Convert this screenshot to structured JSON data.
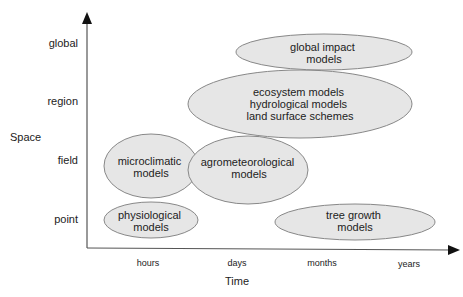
{
  "diagram": {
    "y_axis": {
      "title": "Space",
      "ticks": [
        "global",
        "region",
        "field",
        "point"
      ]
    },
    "x_axis": {
      "title": "Time",
      "ticks": [
        "hours",
        "days",
        "months",
        "years"
      ]
    },
    "colors": {
      "ellipse_fill": "#e6e6e6",
      "ellipse_stroke": "#888888",
      "axis": "#555555",
      "text": "#222222"
    },
    "ellipses": [
      {
        "name": "global-impact-models",
        "lines": [
          "global impact",
          "models"
        ]
      },
      {
        "name": "ecosystem-hydrological-landsurface",
        "lines": [
          "ecosystem models",
          "hydrological models",
          "land surface schemes"
        ]
      },
      {
        "name": "microclimatic-models",
        "lines": [
          "microclimatic",
          "models"
        ]
      },
      {
        "name": "agrometeorological-models",
        "lines": [
          "agrometeorological",
          "models"
        ]
      },
      {
        "name": "physiological-models",
        "lines": [
          "physiological",
          "models"
        ]
      },
      {
        "name": "tree-growth-models",
        "lines": [
          "tree growth",
          "models"
        ]
      }
    ]
  }
}
